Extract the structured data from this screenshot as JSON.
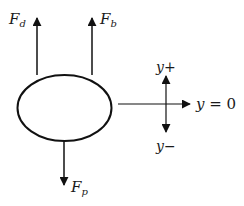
{
  "diagram": {
    "body": {
      "shape": "ellipse",
      "cx": 64.5,
      "cy": 108,
      "rx": 47,
      "ry": 33
    },
    "forces": [
      {
        "name": "drag",
        "symbol": "F",
        "subscript": "d",
        "direction": "up",
        "x": 37,
        "y_start": 75,
        "y_tip": 18
      },
      {
        "name": "buoyancy",
        "symbol": "F",
        "subscript": "b",
        "direction": "up",
        "x": 92,
        "y_start": 75,
        "y_tip": 18
      },
      {
        "name": "weight",
        "symbol": "F",
        "subscript": "p",
        "direction": "down",
        "x": 64,
        "y_start": 141,
        "y_tip": 185
      }
    ],
    "axis": {
      "horizontal": {
        "x_start": 118,
        "x_tip": 190,
        "y": 104,
        "label_var": "y",
        "label_rest": " = 0"
      },
      "vertical": {
        "x": 166,
        "y_top_tip": 76,
        "y_bottom_tip": 132
      },
      "pos_label": {
        "var": "y",
        "sign": "+"
      },
      "neg_label": {
        "var": "y",
        "sign": "−"
      }
    },
    "colors": {
      "stroke": "#111111",
      "background": "#ffffff"
    }
  }
}
